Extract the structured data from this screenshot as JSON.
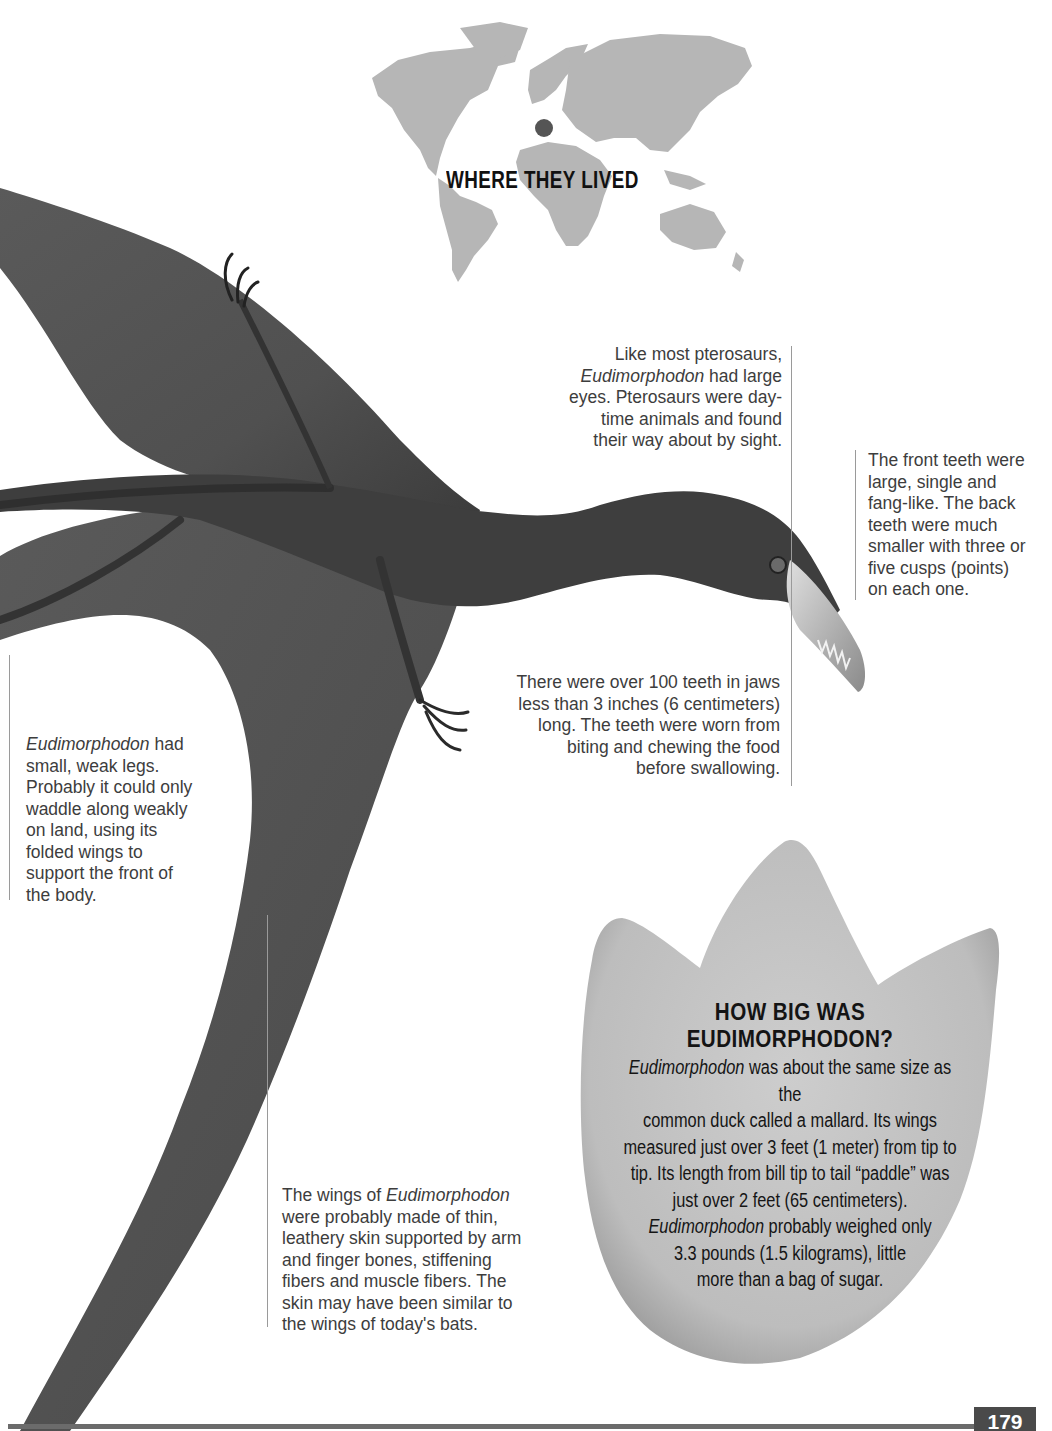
{
  "map": {
    "title": "WHERE THEY LIVED",
    "location_marker": "Europe (Italy)",
    "land_color": "#b4b4b4",
    "marker_color": "#555555"
  },
  "captions": {
    "eyes": {
      "line1": "Like most pterosaurs,",
      "italic": "Eudimorphodon",
      "line2_rest": " had large",
      "line3": "eyes. Pterosaurs were day-",
      "line4": "time animals and found",
      "line5": "their way about by sight."
    },
    "front_teeth": {
      "lines": [
        "The front teeth were",
        "large, single and",
        "fang-like. The back",
        "teeth were much",
        "smaller with three or",
        "five cusps (points)",
        "on each one."
      ]
    },
    "jaws": {
      "lines": [
        "There were over 100 teeth in jaws",
        "less than 3 inches (6 centimeters)",
        "long. The teeth were worn from",
        "biting and chewing the food",
        "before swallowing."
      ]
    },
    "legs": {
      "italic": "Eudimorphodon",
      "line1_rest": " had",
      "lines": [
        "small, weak legs.",
        "Probably it could only",
        "waddle along weakly",
        "on land, using its",
        "folded wings to",
        "support the front of",
        "the body."
      ]
    },
    "wings": {
      "line1_pre": "The wings of ",
      "italic": "Eudimorphodon",
      "lines": [
        "were probably made of thin,",
        "leathery skin supported by arm",
        "and finger bones, stiffening",
        "fibers and muscle fibers. The",
        "skin may have been similar to",
        "the wings of today's bats."
      ]
    }
  },
  "size_box": {
    "title_line1": "HOW BIG WAS",
    "title_line2": "EUDIMORPHODON?",
    "body": {
      "l1_italic": "Eudimorphodon",
      "l1_rest": " was about the same size as the",
      "l2": "common duck called a mallard. Its wings",
      "l3": "measured just over 3 feet (1 meter) from tip to",
      "l4": "tip. Its length from bill tip to tail “paddle” was",
      "l5": "just over 2 feet (65 centimeters).",
      "l6_italic": "Eudimorphodon",
      "l6_rest": " probably weighed only",
      "l7": "3.3 pounds (1.5 kilograms), little",
      "l8": "more than a bag of sugar."
    },
    "fill_color": "#c4c4c4"
  },
  "footer": {
    "page_number": "179",
    "bar_color": "#6b6b6b",
    "tab_color": "#4a4a4a"
  },
  "illustration": {
    "subject": "Eudimorphodon pterosaur",
    "body_color": "#4f4f4f"
  }
}
